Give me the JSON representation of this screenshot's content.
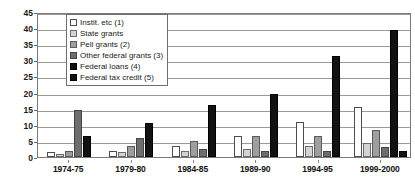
{
  "chart_data": {
    "type": "bar",
    "title": "",
    "xlabel": "",
    "ylabel": "",
    "ylim": [
      0,
      45
    ],
    "ytick_step": 5,
    "yticks": [
      "0",
      "5",
      "10",
      "15",
      "20",
      "25",
      "30",
      "35",
      "40",
      "45"
    ],
    "grid": true,
    "legend_position": "upper-left-inside",
    "categories": [
      "1974-75",
      "1979-80",
      "1984-85",
      "1989-90",
      "1994-95",
      "1999-2000"
    ],
    "series": [
      {
        "name": "Instit. etc (1)",
        "color": "#ffffff",
        "values": [
          1.5,
          2.0,
          3.5,
          6.5,
          11.0,
          15.5
        ]
      },
      {
        "name": "State grants",
        "color": "#d4d4d4",
        "values": [
          1.0,
          1.5,
          2.0,
          2.5,
          3.5,
          4.5
        ]
      },
      {
        "name": "Pell grants (2)",
        "color": "#9e9e9e",
        "values": [
          2.0,
          3.5,
          5.0,
          6.5,
          6.5,
          8.5
        ]
      },
      {
        "name": "Other federal grants (3)",
        "color": "#6e6e6e",
        "values": [
          14.5,
          6.0,
          2.5,
          2.0,
          2.0,
          3.0
        ]
      },
      {
        "name": "Federal loans (4)",
        "color": "#121212",
        "values": [
          6.5,
          10.5,
          16.0,
          19.5,
          31.5,
          39.5
        ]
      },
      {
        "name": "Federal tax credit (5)",
        "color": "#121212",
        "values": [
          0,
          0,
          0,
          0,
          0,
          2.0
        ]
      }
    ]
  },
  "legend": {
    "items": [
      {
        "label": "Instit. etc (1)"
      },
      {
        "label": "State grants"
      },
      {
        "label": "Pell grants (2)"
      },
      {
        "label": "Other federal grants (3)"
      },
      {
        "label": "Federal loans (4)"
      },
      {
        "label": "Federal tax credit (5)"
      }
    ]
  }
}
